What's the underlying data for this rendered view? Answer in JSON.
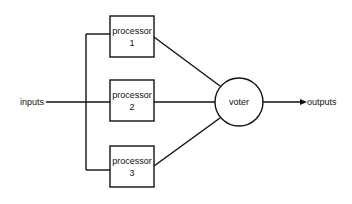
{
  "diagram": {
    "input_label": "inputs",
    "output_label": "outputs",
    "processors": [
      {
        "label": "processor",
        "number": "1"
      },
      {
        "label": "processor",
        "number": "2"
      },
      {
        "label": "processor",
        "number": "3"
      }
    ],
    "voter_label": "voter",
    "colors": {
      "stroke": "#111111",
      "background": "#ffffff"
    }
  }
}
